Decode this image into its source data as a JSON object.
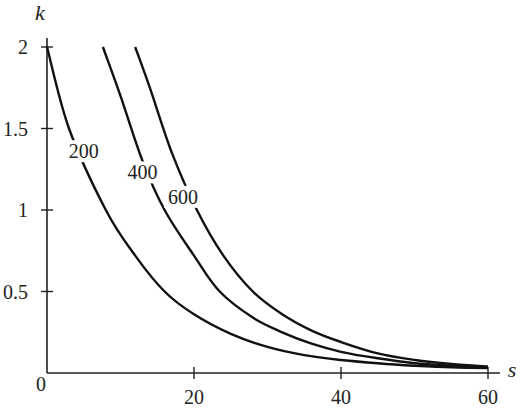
{
  "chart_data": {
    "type": "line",
    "title": "",
    "xlabel": "s",
    "ylabel": "k",
    "xlim": [
      0,
      60
    ],
    "ylim": [
      0,
      2
    ],
    "x_ticks": [
      0,
      20,
      40,
      60
    ],
    "x_tick_labels": [
      "0",
      "20",
      "40",
      "60"
    ],
    "y_ticks": [
      0.5,
      1,
      1.5,
      2
    ],
    "y_tick_labels": [
      "0.5",
      "1",
      "1.5",
      "2"
    ],
    "grid": false,
    "legend": "inline curve labels",
    "series": [
      {
        "name": "200",
        "x": [
          0,
          3,
          8,
          12,
          16,
          20,
          25,
          30,
          35,
          40,
          45,
          50,
          55,
          60
        ],
        "y": [
          2.0,
          1.5,
          1.0,
          0.72,
          0.5,
          0.36,
          0.24,
          0.16,
          0.11,
          0.08,
          0.06,
          0.045,
          0.035,
          0.03
        ]
      },
      {
        "name": "400",
        "x": [
          7.6,
          10,
          13,
          16,
          20,
          23.5,
          28,
          32,
          36,
          40,
          45,
          50,
          55,
          60
        ],
        "y": [
          2.0,
          1.7,
          1.3,
          1.0,
          0.72,
          0.5,
          0.34,
          0.25,
          0.18,
          0.13,
          0.09,
          0.06,
          0.045,
          0.035
        ]
      },
      {
        "name": "600",
        "x": [
          12,
          14,
          17,
          20.4,
          24,
          28,
          32,
          36,
          40,
          45,
          50,
          55,
          60
        ],
        "y": [
          2.0,
          1.75,
          1.35,
          1.0,
          0.72,
          0.5,
          0.36,
          0.26,
          0.19,
          0.12,
          0.08,
          0.055,
          0.04
        ]
      }
    ],
    "annotations": [
      {
        "text": "200",
        "x": 5,
        "y": 1.33
      },
      {
        "text": "400",
        "x": 13,
        "y": 1.2
      },
      {
        "text": "600",
        "x": 18.5,
        "y": 1.05
      }
    ]
  },
  "axes": {
    "x_title": "s",
    "y_title": "k",
    "origin_label": "0"
  }
}
